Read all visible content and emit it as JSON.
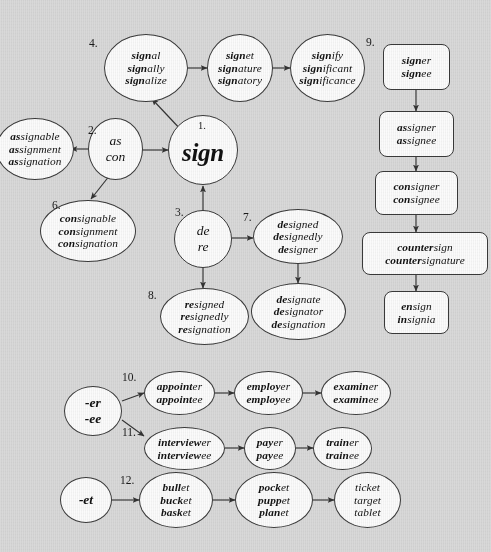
{
  "diagram": {
    "background_color": "#d9d9d9",
    "node_fill": "#fbfbfb",
    "stroke_color": "#3a3a3a",
    "numbers": {
      "n1": "1.",
      "n2": "2.",
      "n3": "3.",
      "n4": "4.",
      "n6": "6.",
      "n7": "7.",
      "n8": "8.",
      "n9": "9.",
      "n10": "10.",
      "n11": "11.",
      "n12": "12."
    },
    "nodes": {
      "hub_sign": {
        "label": "sign",
        "number": "1.",
        "shape": "circle"
      },
      "prefix_as_con": {
        "number": "2.",
        "shape": "circle",
        "lines": [
          "as",
          "con"
        ]
      },
      "prefix_de_re": {
        "number": "3.",
        "shape": "circle",
        "lines": [
          "de",
          "re"
        ]
      },
      "signal_group": {
        "number": "4.",
        "shape": "ellipse",
        "lines": [
          {
            "bold": "sign",
            "rest": "al"
          },
          {
            "bold": "sign",
            "rest": "ally"
          },
          {
            "bold": "sign",
            "rest": "alize"
          }
        ]
      },
      "signet_group": {
        "number": "",
        "shape": "ellipse",
        "lines": [
          {
            "bold": "sign",
            "rest": "et"
          },
          {
            "bold": "sign",
            "rest": "ature"
          },
          {
            "bold": "sign",
            "rest": "atory"
          }
        ]
      },
      "signify_group": {
        "number": "",
        "shape": "ellipse",
        "lines": [
          {
            "bold": "sign",
            "rest": "ify"
          },
          {
            "bold": "sign",
            "rest": "ificant"
          },
          {
            "bold": "sign",
            "rest": "ificance"
          }
        ]
      },
      "assign_group": {
        "number": "",
        "shape": "ellipse",
        "lines": [
          {
            "bold": "as",
            "rest": "signable"
          },
          {
            "bold": "as",
            "rest": "signment"
          },
          {
            "bold": "as",
            "rest": "signation"
          }
        ]
      },
      "consign_group": {
        "number": "6.",
        "shape": "ellipse",
        "lines": [
          {
            "bold": "con",
            "rest": "signable"
          },
          {
            "bold": "con",
            "rest": "signment"
          },
          {
            "bold": "con",
            "rest": "signation"
          }
        ]
      },
      "design_group": {
        "number": "7.",
        "shape": "ellipse",
        "lines": [
          {
            "bold": "de",
            "rest": "signed"
          },
          {
            "bold": "de",
            "rest": "signedly"
          },
          {
            "bold": "de",
            "rest": "signer"
          }
        ]
      },
      "designate_group": {
        "number": "",
        "shape": "ellipse",
        "lines": [
          {
            "bold": "de",
            "rest": "signate"
          },
          {
            "bold": "de",
            "rest": "signator"
          },
          {
            "bold": "de",
            "rest": "signation"
          }
        ]
      },
      "resign_group": {
        "number": "8.",
        "shape": "ellipse",
        "lines": [
          {
            "bold": "re",
            "rest": "signed"
          },
          {
            "bold": "re",
            "rest": "signedly"
          },
          {
            "bold": "re",
            "rest": "signation"
          }
        ]
      },
      "signer_box": {
        "number": "9.",
        "shape": "rounded-box",
        "lines": [
          {
            "bold": "sign",
            "rest": "er"
          },
          {
            "bold": "sign",
            "rest": "ee"
          }
        ]
      },
      "assigner_box": {
        "number": "",
        "shape": "rounded-box",
        "lines": [
          {
            "bold": "as",
            "rest": "signer"
          },
          {
            "bold": "as",
            "rest": "signee"
          }
        ]
      },
      "consigner_box": {
        "number": "",
        "shape": "rounded-box",
        "lines": [
          {
            "bold": "con",
            "rest": "signer"
          },
          {
            "bold": "con",
            "rest": "signee"
          }
        ]
      },
      "countersign_box": {
        "number": "",
        "shape": "rounded-box",
        "lines": [
          {
            "bold": "counter",
            "rest": "sign"
          },
          {
            "bold": "counter",
            "rest": "signature"
          }
        ]
      },
      "ensign_box": {
        "number": "",
        "shape": "rounded-box",
        "lines": [
          {
            "bold": "en",
            "rest": "sign"
          },
          {
            "bold": "in",
            "rest": "signia"
          }
        ]
      },
      "suffix_er_ee": {
        "number": "",
        "shape": "circle",
        "lines": [
          "-er",
          "-ee"
        ]
      },
      "appointer_group": {
        "number": "10.",
        "shape": "ellipse",
        "lines": [
          {
            "bold": "appoint",
            "rest": "er"
          },
          {
            "bold": "appoint",
            "rest": "ee"
          }
        ]
      },
      "employer_group": {
        "number": "",
        "shape": "ellipse",
        "lines": [
          {
            "bold": "employ",
            "rest": "er"
          },
          {
            "bold": "employ",
            "rest": "ee"
          }
        ]
      },
      "examiner_group": {
        "number": "",
        "shape": "ellipse",
        "lines": [
          {
            "bold": "examin",
            "rest": "er"
          },
          {
            "bold": "examin",
            "rest": "ee"
          }
        ]
      },
      "interviewer_group": {
        "number": "11.",
        "shape": "ellipse",
        "lines": [
          {
            "bold": "interview",
            "rest": "er"
          },
          {
            "bold": "interview",
            "rest": "ee"
          }
        ]
      },
      "payer_group": {
        "number": "",
        "shape": "ellipse",
        "lines": [
          {
            "bold": "pay",
            "rest": "er"
          },
          {
            "bold": "pay",
            "rest": "ee"
          }
        ]
      },
      "trainer_group": {
        "number": "",
        "shape": "ellipse",
        "lines": [
          {
            "bold": "train",
            "rest": "er"
          },
          {
            "bold": "train",
            "rest": "ee"
          }
        ]
      },
      "suffix_et": {
        "number": "",
        "shape": "circle",
        "lines": [
          "-et"
        ]
      },
      "bullet_group": {
        "number": "12.",
        "shape": "ellipse",
        "lines": [
          {
            "bold": "bull",
            "rest": "et"
          },
          {
            "bold": "buck",
            "rest": "et"
          },
          {
            "bold": "bask",
            "rest": "et"
          }
        ]
      },
      "pocket_group": {
        "number": "",
        "shape": "ellipse",
        "lines": [
          {
            "bold": "pock",
            "rest": "et"
          },
          {
            "bold": "pupp",
            "rest": "et"
          },
          {
            "bold": "plan",
            "rest": "et"
          }
        ]
      },
      "ticket_group": {
        "number": "",
        "shape": "ellipse",
        "lines": [
          {
            "bold": "",
            "rest": "ticket"
          },
          {
            "bold": "",
            "rest": "target"
          },
          {
            "bold": "",
            "rest": "tablet"
          }
        ]
      }
    }
  }
}
